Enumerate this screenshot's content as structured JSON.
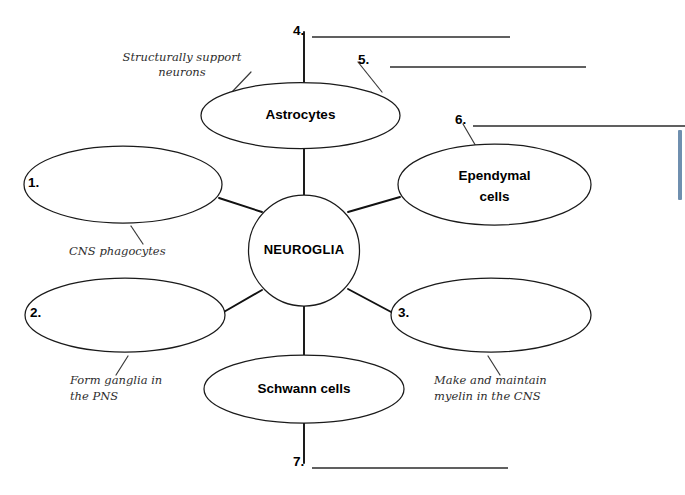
{
  "page": {
    "background_color": "#ffffff",
    "width": 685,
    "height": 495
  },
  "colors": {
    "ink": "#1a1a1a",
    "connector": "#111111",
    "hint_ink": "#2e2e2e",
    "scroll_marker": "#6f8faf"
  },
  "center_node": {
    "label": "NEUROGLIA",
    "shape": "circle"
  },
  "nodes": [
    {
      "id": "node-1",
      "label": "1.",
      "filled": false,
      "shape": "ellipse",
      "position": "left-upper"
    },
    {
      "id": "node-2",
      "label": "2.",
      "filled": false,
      "shape": "ellipse",
      "position": "left-lower"
    },
    {
      "id": "node-3",
      "label": "3.",
      "filled": false,
      "shape": "ellipse",
      "position": "right-lower"
    },
    {
      "id": "node-astrocytes",
      "label": "Astrocytes",
      "filled": true,
      "shape": "ellipse",
      "position": "top"
    },
    {
      "id": "node-ependymal",
      "label": "Ependymal\ncells",
      "line1": "Ependymal",
      "line2": "cells",
      "filled": true,
      "shape": "ellipse",
      "position": "right-upper"
    },
    {
      "id": "node-schwann",
      "label": "Schwann cells",
      "filled": true,
      "shape": "ellipse",
      "position": "bottom"
    }
  ],
  "hints": [
    {
      "id": "hint-astrocytes",
      "line1": "Structurally support",
      "line2": "neurons",
      "for_node": "node-astrocytes"
    },
    {
      "id": "hint-node1",
      "line1": "CNS phagocytes",
      "line2": "",
      "for_node": "node-1"
    },
    {
      "id": "hint-node2",
      "line1": "Form ganglia in",
      "line2": "the PNS",
      "for_node": "node-2"
    },
    {
      "id": "hint-node3",
      "line1": "Make and maintain",
      "line2": "myelin in the CNS",
      "for_node": "node-3"
    }
  ],
  "answer_blanks": [
    {
      "id": "blank-4",
      "number": "4.",
      "value": "",
      "for_node": "node-astrocytes"
    },
    {
      "id": "blank-5",
      "number": "5.",
      "value": "",
      "for_node": "node-astrocytes"
    },
    {
      "id": "blank-6",
      "number": "6.",
      "value": "",
      "for_node": "node-ependymal"
    },
    {
      "id": "blank-7",
      "number": "7.",
      "value": "",
      "for_node": "node-schwann"
    }
  ],
  "labels": {
    "n1": "1.",
    "n2": "2.",
    "n3": "3.",
    "n4": "4.",
    "n5": "5.",
    "n6": "6.",
    "n7": "7.",
    "astrocytes": "Astrocytes",
    "ependymal_line1": "Ependymal",
    "ependymal_line2": "cells",
    "schwann": "Schwann cells",
    "neuroglia": "NEUROGLIA",
    "hint_astro_1": "Structurally support",
    "hint_astro_2": "neurons",
    "hint_1": "CNS phagocytes",
    "hint_2_line1": "Form ganglia in",
    "hint_2_line2": "the PNS",
    "hint_3_line1": "Make and maintain",
    "hint_3_line2": "myelin in the CNS"
  }
}
